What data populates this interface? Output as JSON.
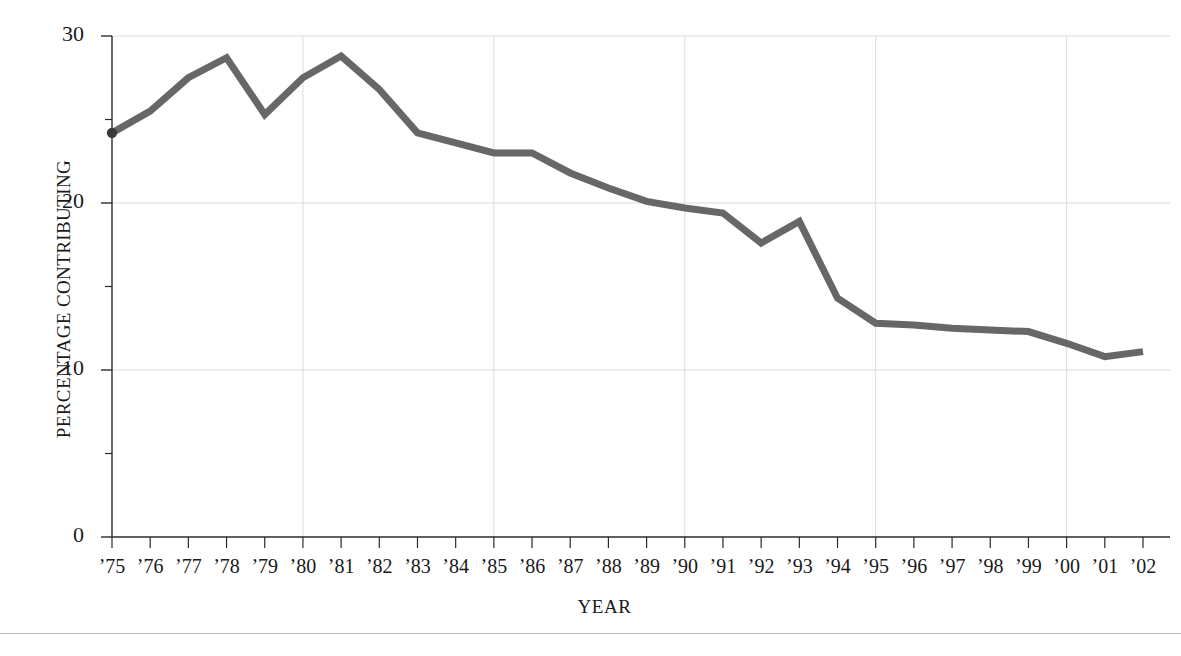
{
  "chart_data": {
    "type": "line",
    "title": "",
    "xlabel": "YEAR",
    "ylabel": "PERCENTAGE CONTRIBUTING",
    "categories": [
      "’75",
      "’76",
      "’77",
      "’78",
      "’79",
      "’80",
      "’81",
      "’82",
      "’83",
      "’84",
      "’85",
      "’86",
      "’87",
      "’88",
      "’89",
      "’90",
      "’91",
      "’92",
      "’93",
      "’94",
      "’95",
      "’96",
      "’97",
      "’98",
      "’99",
      "’00",
      "’01",
      "’02"
    ],
    "x": [
      1975,
      1976,
      1977,
      1978,
      1979,
      1980,
      1981,
      1982,
      1983,
      1984,
      1985,
      1986,
      1987,
      1988,
      1989,
      1990,
      1991,
      1992,
      1993,
      1994,
      1995,
      1996,
      1997,
      1998,
      1999,
      2000,
      2001,
      2002
    ],
    "values": [
      24.2,
      25.5,
      27.5,
      28.7,
      25.3,
      27.5,
      28.8,
      26.8,
      24.2,
      23.6,
      23.0,
      23.0,
      21.8,
      20.9,
      20.1,
      19.7,
      19.4,
      17.6,
      18.9,
      14.3,
      12.8,
      12.7,
      12.5,
      12.4,
      12.3,
      11.6,
      10.8,
      11.1
    ],
    "ylim": [
      0,
      30
    ],
    "yticks": [
      0,
      10,
      20,
      30
    ],
    "ytick_labels": [
      "0",
      "10",
      "20",
      "30"
    ],
    "yminor_ticks": [
      5,
      15,
      25
    ],
    "xgridlines": [
      1980,
      1985,
      1990,
      1995,
      2000
    ],
    "ygridlines": [
      10,
      20,
      30
    ],
    "grid": true,
    "legend": "none",
    "series_name": "Percentage contributing",
    "line_color": "#676767",
    "grid_color": "#dcdcdc",
    "axis_color": "#2b2b2b",
    "background": "#ffffff",
    "marker_start": true
  }
}
